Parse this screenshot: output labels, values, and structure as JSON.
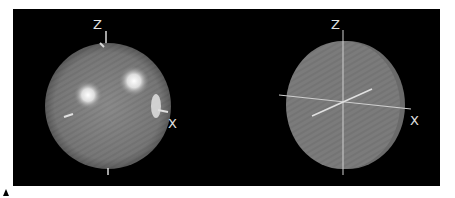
{
  "views": [
    {
      "name": "sphere-view",
      "shape": "sphere",
      "axis_labels": {
        "z": "Z",
        "x": "X"
      }
    },
    {
      "name": "disc-view",
      "shape": "disc",
      "axis_labels": {
        "z": "Z",
        "x": "X"
      }
    }
  ],
  "colors": {
    "background": "#000000",
    "surface": "#7a7a7a",
    "axis": "#d8d8d8",
    "highlight": "#ffffff"
  }
}
